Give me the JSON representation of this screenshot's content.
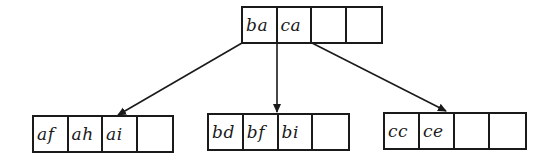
{
  "diagram": {
    "type": "b-tree",
    "root": {
      "keys": [
        "ba",
        "ca",
        "",
        ""
      ]
    },
    "children": [
      {
        "keys": [
          "af",
          "ah",
          "ai",
          ""
        ]
      },
      {
        "keys": [
          "bd",
          "bf",
          "bi",
          ""
        ]
      },
      {
        "keys": [
          "cc",
          "ce",
          "",
          ""
        ]
      }
    ],
    "edges": [
      {
        "from": "root.pointer0",
        "to": "children.0"
      },
      {
        "from": "root.pointer1",
        "to": "children.1"
      },
      {
        "from": "root.pointer2",
        "to": "children.2"
      }
    ],
    "colors": {
      "stroke": "#1a1a1a",
      "background": "#ffffff"
    }
  }
}
